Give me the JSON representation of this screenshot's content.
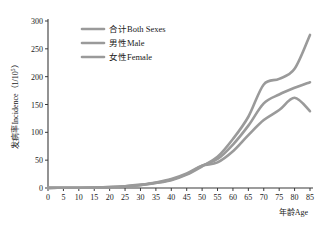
{
  "chart_data": {
    "type": "line",
    "title": "",
    "subtitle": "",
    "xlabel": "年龄Age",
    "ylabel": "发病率Incidence（1/10⁵）",
    "ylabel_parts": {
      "prefix": "发病率Incidence（1/10",
      "sup": "5",
      "suffix": "）"
    },
    "xlim": [
      0,
      85
    ],
    "ylim": [
      0,
      300
    ],
    "xticks": [
      0,
      5,
      10,
      15,
      20,
      25,
      30,
      35,
      40,
      45,
      50,
      55,
      60,
      65,
      70,
      75,
      80,
      85
    ],
    "yticks": [
      0,
      50,
      100,
      150,
      200,
      250,
      300
    ],
    "xtick_labels": [
      "0",
      "5",
      "10",
      "15",
      "20",
      "25",
      "30",
      "35",
      "40",
      "45",
      "50",
      "55",
      "60",
      "65",
      "70",
      "75",
      "80",
      "85"
    ],
    "ytick_labels": [
      "0",
      "50",
      "100",
      "150",
      "200",
      "250",
      "300"
    ],
    "grid": false,
    "legend_position": "upper-left-inside",
    "x": [
      0,
      5,
      10,
      15,
      20,
      25,
      30,
      35,
      40,
      45,
      50,
      55,
      60,
      65,
      70,
      75,
      80,
      85
    ],
    "series": [
      {
        "name": "合计Both Sexes",
        "color": "#9a9a9a",
        "values": [
          0.3,
          0.4,
          0.5,
          0.8,
          1.5,
          3.0,
          5.5,
          9.5,
          15.0,
          25.0,
          40.0,
          52.0,
          78.0,
          112.0,
          152.0,
          168.0,
          180.0,
          190.0
        ]
      },
      {
        "name": "男性Male",
        "color": "#9a9a9a",
        "values": [
          0.3,
          0.4,
          0.5,
          0.8,
          1.4,
          2.8,
          5.0,
          9.0,
          14.0,
          24.0,
          39.0,
          56.0,
          88.0,
          128.0,
          186.0,
          196.0,
          214.0,
          275.0
        ]
      },
      {
        "name": "女性Female",
        "color": "#9a9a9a",
        "values": [
          0.3,
          0.4,
          0.5,
          0.8,
          1.6,
          3.2,
          6.0,
          10.0,
          16.0,
          26.0,
          40.0,
          46.0,
          66.0,
          95.0,
          122.0,
          140.0,
          162.0,
          138.0
        ]
      }
    ]
  },
  "legend": {
    "items": [
      {
        "label": "合计Both Sexes"
      },
      {
        "label": "男性Male"
      },
      {
        "label": "女性Female"
      }
    ]
  },
  "style": {
    "line_color": "#9a9a9a",
    "axis_color": "#3a3a3a",
    "text_color": "#1a1a1a",
    "background": "#ffffff",
    "line_width": 2.6
  }
}
